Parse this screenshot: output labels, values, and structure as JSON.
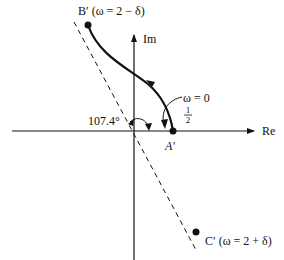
{
  "diagram": {
    "type": "nyquist-plot-sketch",
    "axes": {
      "real_label": "Re",
      "imag_label": "Im"
    },
    "points": {
      "b_prime": {
        "label": "B′ (ω = 2 − δ)"
      },
      "a_prime": {
        "label": "A′"
      },
      "c_prime": {
        "label": "C′ (ω = 2 + δ)"
      }
    },
    "annotations": {
      "omega_zero": "ω = 0",
      "half_num": "1",
      "half_den": "2",
      "angle": "107.4°"
    },
    "colors": {
      "ink": "#111111",
      "background": "#ffffff"
    }
  }
}
